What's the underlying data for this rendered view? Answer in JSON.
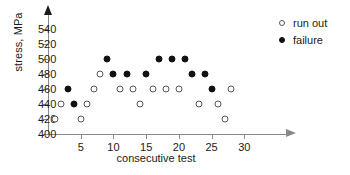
{
  "chart_data": {
    "type": "scatter",
    "title": "",
    "xlabel": "consecutive test",
    "ylabel": "stress, MPa",
    "xlim": [
      0,
      33
    ],
    "ylim": [
      400,
      550
    ],
    "yticks": [
      400,
      420,
      440,
      460,
      480,
      500,
      520,
      540
    ],
    "xticks": [
      5,
      10,
      15,
      20,
      25,
      30
    ],
    "grid": false,
    "legend_position": "top-right",
    "series": [
      {
        "name": "run out",
        "marker": "open-circle",
        "color": "#555555",
        "points": [
          {
            "x": 1,
            "y": 420
          },
          {
            "x": 2,
            "y": 440
          },
          {
            "x": 5,
            "y": 420
          },
          {
            "x": 6,
            "y": 440
          },
          {
            "x": 7,
            "y": 460
          },
          {
            "x": 8,
            "y": 480
          },
          {
            "x": 11,
            "y": 460
          },
          {
            "x": 13,
            "y": 460
          },
          {
            "x": 14,
            "y": 440
          },
          {
            "x": 16,
            "y": 460
          },
          {
            "x": 18,
            "y": 460
          },
          {
            "x": 20,
            "y": 460
          },
          {
            "x": 23,
            "y": 440
          },
          {
            "x": 26,
            "y": 440
          },
          {
            "x": 27,
            "y": 420
          },
          {
            "x": 28,
            "y": 460
          }
        ]
      },
      {
        "name": "failure",
        "marker": "filled-circle",
        "color": "#111111",
        "points": [
          {
            "x": 3,
            "y": 460
          },
          {
            "x": 4,
            "y": 440
          },
          {
            "x": 9,
            "y": 500
          },
          {
            "x": 10,
            "y": 480
          },
          {
            "x": 12,
            "y": 480
          },
          {
            "x": 15,
            "y": 480
          },
          {
            "x": 17,
            "y": 500
          },
          {
            "x": 19,
            "y": 500
          },
          {
            "x": 21,
            "y": 500
          },
          {
            "x": 22,
            "y": 480
          },
          {
            "x": 24,
            "y": 480
          },
          {
            "x": 25,
            "y": 460
          }
        ]
      }
    ]
  },
  "legend": {
    "items": [
      {
        "label": "run out",
        "marker": "open-circle"
      },
      {
        "label": "failure",
        "marker": "filled-circle"
      }
    ]
  }
}
